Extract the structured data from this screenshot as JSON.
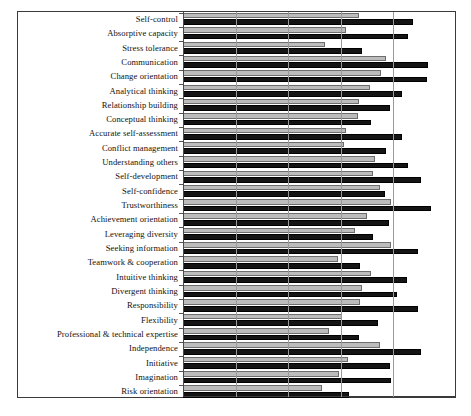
{
  "figure": {
    "name": "competency-importance-bar-chart",
    "frame_color": "#3a3a3a",
    "colors": {
      "series_light": "#bcbcbc",
      "series_dark": "#141414",
      "gridline": "#9a9a9a",
      "text": "#111111"
    }
  },
  "chart_data": {
    "type": "bar",
    "orientation": "horizontal",
    "title": "",
    "subtitle": "",
    "xlabel": "",
    "ylabel": "",
    "xlim": [
      0,
      5.17
    ],
    "grid": true,
    "gridlines": [
      1,
      2,
      3,
      4
    ],
    "legend": [],
    "legend_position": "none",
    "categories": [
      "Self-control",
      "Absorptive capacity",
      "Stress tolerance",
      "Communication",
      "Change orientation",
      "Analytical thinking",
      "Relationship building",
      "Conceptual thinking",
      "Accurate self-assessment",
      "Conflict management",
      "Understanding others",
      "Self-development",
      "Self-confidence",
      "Trustworthiness",
      "Achievement orientation",
      "Leveraging diversity",
      "Seeking information",
      "Teamwork & cooperation",
      "Intuitive thinking",
      "Divergent thinking",
      "Responsibility",
      "Flexibility",
      "Professional & technical expertise",
      "Independence",
      "Initiative",
      "Imagination",
      "Risk orientation"
    ],
    "series": [
      {
        "name": "series-light",
        "color": "#bcbcbc",
        "values": [
          3.34,
          3.09,
          2.69,
          3.85,
          3.77,
          3.55,
          3.34,
          3.32,
          3.09,
          3.06,
          3.64,
          3.62,
          3.75,
          3.96,
          3.49,
          3.26,
          3.96,
          2.94,
          3.58,
          3.4,
          3.36,
          3.02,
          2.77,
          3.75,
          3.13,
          2.96,
          2.64
        ]
      },
      {
        "name": "series-dark",
        "color": "#141414",
        "values": [
          4.38,
          4.28,
          3.4,
          4.66,
          4.64,
          4.17,
          3.94,
          3.58,
          4.17,
          3.85,
          4.28,
          4.53,
          3.83,
          4.72,
          3.92,
          3.62,
          4.47,
          3.36,
          4.26,
          4.06,
          4.47,
          3.7,
          3.34,
          4.53,
          3.94,
          3.96,
          3.15
        ]
      }
    ]
  }
}
